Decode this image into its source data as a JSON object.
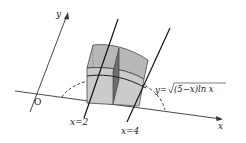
{
  "diagram": {
    "type": "3d-solid-with-cross-sections",
    "axes": {
      "x_label": "x",
      "y_label": "y",
      "origin_label": "O"
    },
    "lines": [
      {
        "label": "x=2"
      },
      {
        "label": "x=4"
      }
    ],
    "curve_label": {
      "prefix": "y=",
      "radicand": "(5−x)ln x"
    },
    "colors": {
      "solid_fill": "#c8c8c8",
      "solid_top": "#b4b4b4",
      "cross_section": "#6e6e6e",
      "stroke": "#222222"
    }
  }
}
